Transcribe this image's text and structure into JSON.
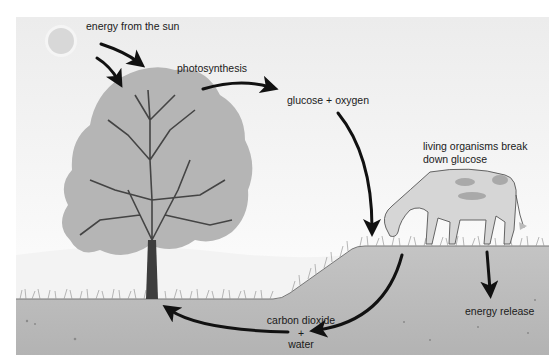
{
  "diagram": {
    "labels": {
      "energy_from_sun": "energy from the sun",
      "photosynthesis": "photosynthesis",
      "glucose_oxygen": "glucose + oxygen",
      "organisms_line1": "living organisms break",
      "organisms_line2": "down glucose",
      "energy_release": "energy release",
      "co2_line1": "carbon dioxide",
      "co2_plus": "+",
      "co2_line2": "water"
    },
    "elements": [
      "sun",
      "tree",
      "cow",
      "grass",
      "ground",
      "hill"
    ],
    "arrows": [
      {
        "from": "sun",
        "to": "tree",
        "meaning": "energy from the sun"
      },
      {
        "from": "tree",
        "to": "glucose + oxygen",
        "meaning": "photosynthesis"
      },
      {
        "from": "glucose + oxygen",
        "to": "cow",
        "meaning": "consumption"
      },
      {
        "from": "cow",
        "to": "energy release",
        "meaning": "respiration energy"
      },
      {
        "from": "cow",
        "to": "carbon dioxide + water",
        "meaning": "respiration products"
      },
      {
        "from": "carbon dioxide + water",
        "to": "tree",
        "meaning": "taken up by plant"
      }
    ],
    "colors": {
      "sky_top": "#eeeeee",
      "sky_bottom": "#fbfbfb",
      "ground": "#b9b9b9",
      "foliage": "#b5b5b5",
      "trunk": "#3d3d3d",
      "arrow": "#111111",
      "sun": "#d9d9d9"
    }
  }
}
